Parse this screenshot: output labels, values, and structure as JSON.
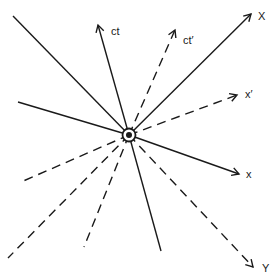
{
  "diagram": {
    "title": "",
    "origin": {
      "x": 129,
      "y": 135
    },
    "stroke_color": "#1a1a1a",
    "axes": [
      {
        "id": "ct",
        "label": "ct",
        "style": "solid",
        "arrow": [
          98,
          25
        ],
        "tail": [
          161,
          251
        ],
        "label_pos": [
          111,
          35
        ]
      },
      {
        "id": "ct-prime",
        "label": "ct′",
        "style": "dashed",
        "arrow": [
          175,
          30
        ],
        "tail": [
          84,
          247
        ],
        "label_pos": [
          183,
          44
        ]
      },
      {
        "id": "X",
        "label": "X",
        "style": "solid",
        "arrow": [
          251,
          14
        ],
        "tail": [
          8,
          258
        ],
        "tail_style": "dashed",
        "label_pos": [
          258,
          20
        ]
      },
      {
        "id": "x-prime",
        "label": "x′",
        "style": "dashed",
        "arrow": [
          237,
          95
        ],
        "tail": [
          21,
          182
        ],
        "label_pos": [
          245,
          98
        ]
      },
      {
        "id": "x",
        "label": "x",
        "style": "solid",
        "arrow": [
          239,
          174
        ],
        "tail": [
          18,
          102
        ],
        "label_pos": [
          246,
          178
        ]
      },
      {
        "id": "Y",
        "label": "Y",
        "style": "dashed",
        "arrow": [
          253,
          267
        ],
        "tail": [
          13,
          16
        ],
        "tail_style": "solid",
        "label_pos": [
          262,
          272
        ]
      }
    ]
  }
}
